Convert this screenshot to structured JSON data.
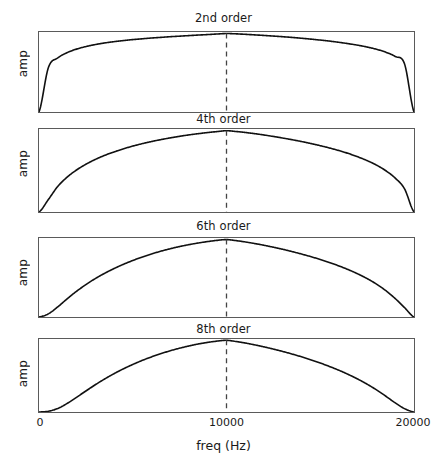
{
  "figure": {
    "width": 447,
    "height": 463,
    "background": "#ffffff",
    "line_color": "#111111",
    "axis_color": "#5a5a5a",
    "marker_color": "#444444"
  },
  "axis": {
    "xlabel": "freq (Hz)",
    "ylabel": "amp",
    "xticks": [
      0,
      10000,
      20000
    ],
    "xtick_labels": [
      "0",
      "10000",
      "20000"
    ],
    "xlim": [
      0,
      20000
    ],
    "ylim": [
      0,
      1.0
    ],
    "grid": false,
    "center_marker_value": 10000,
    "center_marker_style": "dashed"
  },
  "panels": [
    {
      "title": "2nd order",
      "order": 2,
      "ylabel": "amp"
    },
    {
      "title": "4th order",
      "order": 4,
      "ylabel": "amp"
    },
    {
      "title": "6th order",
      "order": 6,
      "ylabel": "amp"
    },
    {
      "title": "8th order",
      "order": 8,
      "ylabel": "amp"
    }
  ],
  "chart_data": {
    "type": "line",
    "title": "",
    "subplots": true,
    "xlabel": "freq (Hz)",
    "ylabel": "amp",
    "xlim": [
      0,
      20000
    ],
    "ylim": [
      0,
      1.0
    ],
    "grid": false,
    "legend": "none",
    "annotations": [
      {
        "type": "vline",
        "x": 10000,
        "style": "dashed",
        "label": ""
      }
    ],
    "x": [
      0,
      500,
      1000,
      1500,
      2000,
      2500,
      3000,
      3500,
      4000,
      4500,
      5000,
      5500,
      6000,
      6500,
      7000,
      7500,
      8000,
      8500,
      9000,
      9500,
      10000,
      10500,
      11000,
      11500,
      12000,
      12500,
      13000,
      13500,
      14000,
      14500,
      15000,
      15500,
      16000,
      16500,
      17000,
      17500,
      18000,
      18500,
      19000,
      19500,
      20000
    ],
    "series": [
      {
        "name": "2nd order",
        "order": 2,
        "values": [
          0.0,
          0.555,
          0.676,
          0.742,
          0.786,
          0.818,
          0.843,
          0.863,
          0.879,
          0.893,
          0.905,
          0.915,
          0.925,
          0.933,
          0.941,
          0.948,
          0.955,
          0.962,
          0.968,
          0.975,
          0.981,
          0.977,
          0.971,
          0.964,
          0.957,
          0.949,
          0.941,
          0.932,
          0.922,
          0.911,
          0.899,
          0.886,
          0.871,
          0.854,
          0.835,
          0.812,
          0.784,
          0.747,
          0.694,
          0.598,
          0.0
        ]
      },
      {
        "name": "4th order",
        "order": 4,
        "values": [
          0.0,
          0.15,
          0.308,
          0.42,
          0.506,
          0.575,
          0.633,
          0.682,
          0.724,
          0.761,
          0.794,
          0.823,
          0.849,
          0.872,
          0.893,
          0.912,
          0.929,
          0.944,
          0.957,
          0.969,
          0.979,
          0.97,
          0.958,
          0.944,
          0.928,
          0.91,
          0.891,
          0.871,
          0.849,
          0.825,
          0.799,
          0.771,
          0.74,
          0.705,
          0.665,
          0.619,
          0.565,
          0.497,
          0.408,
          0.277,
          0.0
        ]
      },
      {
        "name": "6th order",
        "order": 6,
        "values": [
          0.0,
          0.04,
          0.128,
          0.23,
          0.325,
          0.41,
          0.486,
          0.553,
          0.613,
          0.667,
          0.715,
          0.759,
          0.798,
          0.833,
          0.864,
          0.892,
          0.916,
          0.937,
          0.955,
          0.97,
          0.98,
          0.967,
          0.95,
          0.93,
          0.908,
          0.883,
          0.857,
          0.828,
          0.797,
          0.764,
          0.728,
          0.689,
          0.646,
          0.599,
          0.546,
          0.486,
          0.416,
          0.333,
          0.233,
          0.118,
          0.0
        ]
      },
      {
        "name": "8th order",
        "order": 8,
        "values": [
          0.0,
          0.01,
          0.048,
          0.117,
          0.201,
          0.288,
          0.373,
          0.452,
          0.525,
          0.591,
          0.651,
          0.706,
          0.755,
          0.799,
          0.839,
          0.874,
          0.905,
          0.932,
          0.954,
          0.971,
          0.982,
          0.966,
          0.945,
          0.92,
          0.892,
          0.862,
          0.829,
          0.794,
          0.756,
          0.715,
          0.671,
          0.623,
          0.571,
          0.514,
          0.451,
          0.381,
          0.303,
          0.216,
          0.124,
          0.045,
          0.0
        ]
      }
    ]
  }
}
